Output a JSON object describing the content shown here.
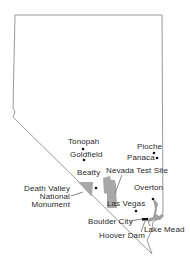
{
  "map": {
    "region": "Nevada",
    "colors": {
      "border": "#9a9a9a",
      "shaded_area": "#a8a8a8",
      "lake": "#a0a0a0",
      "dot": "#111111",
      "text": "#2a2a2a"
    },
    "places": [
      {
        "id": "tonopah",
        "label": "Tonopah",
        "x": 68,
        "y": 138,
        "dot": [
          83,
          149
        ]
      },
      {
        "id": "goldfield",
        "label": "Goldfield",
        "x": 70,
        "y": 151,
        "dot": [
          84,
          160
        ]
      },
      {
        "id": "pioche",
        "label": "Pioche",
        "x": 137,
        "y": 143,
        "dot": [
          154,
          153
        ]
      },
      {
        "id": "panaca",
        "label": "Panaca",
        "x": 127,
        "y": 154,
        "dot": [
          157,
          158
        ]
      },
      {
        "id": "beatty",
        "label": "Beatty",
        "x": 77,
        "y": 169,
        "dot": [
          96,
          188
        ]
      },
      {
        "id": "overton",
        "label": "Overton",
        "x": 134,
        "y": 184,
        "dot": [
          153,
          199
        ]
      },
      {
        "id": "las-vegas",
        "label": "Las Vegas",
        "x": 107,
        "y": 200,
        "dot": [
          136,
          211
        ]
      },
      {
        "id": "boulder-city",
        "label": "Boulder City",
        "x": 88,
        "y": 218,
        "dot": [
          144,
          219
        ]
      },
      {
        "id": "hoover-dam",
        "label": "Hoover Dam",
        "x": 99,
        "y": 232
      },
      {
        "id": "lake-mead",
        "label": "Lake Mead",
        "x": 144,
        "y": 226
      }
    ],
    "areas": [
      {
        "id": "nevada-test-site",
        "label": "Nevada Test Site",
        "x": 106,
        "y": 167
      },
      {
        "id": "death-valley",
        "label_lines": [
          "Death Valley",
          "National",
          "Monument"
        ],
        "x": 26,
        "y": 185
      }
    ]
  }
}
